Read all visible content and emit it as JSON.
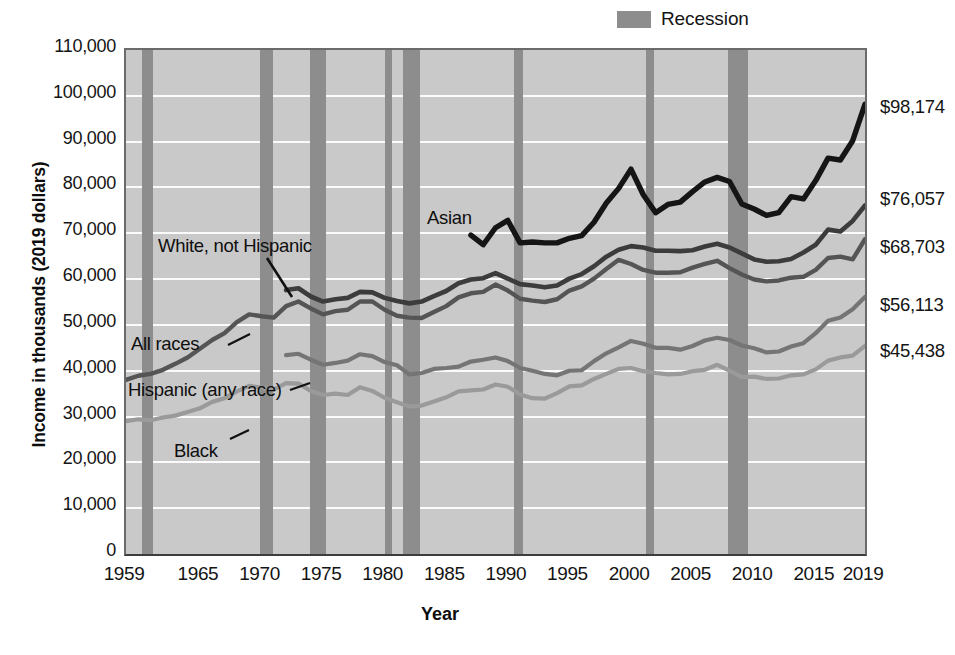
{
  "legend": {
    "recession_label": "Recession",
    "swatch_color": "#8d8d8d"
  },
  "axes": {
    "ylabel": "Income in thousands (2019 dollars)",
    "xlabel": "Year",
    "yticks": [
      "0",
      "10,000",
      "20,000",
      "30,000",
      "40,000",
      "50,000",
      "60,000",
      "70,000",
      "80,000",
      "90,000",
      "100,000",
      "110,000"
    ],
    "xticks": [
      "1959",
      "1965",
      "1970",
      "1975",
      "1980",
      "1985",
      "1990",
      "1995",
      "2000",
      "2005",
      "2010",
      "2015",
      "2019"
    ]
  },
  "annotations": {
    "asian": "Asian",
    "white_not_hispanic": "White, not Hispanic",
    "all_races": "All races",
    "hispanic": "Hispanic (any race)",
    "black": "Black"
  },
  "end_labels": {
    "asian": "$98,174",
    "white_not_hispanic": "$76,057",
    "all_races": "$68,703",
    "hispanic": "$56,113",
    "black": "$45,438"
  },
  "chart_data": {
    "type": "line",
    "title": "",
    "xlabel": "Year",
    "ylabel": "Income in thousands (2019 dollars)",
    "xlim": [
      1959,
      2019
    ],
    "ylim": [
      0,
      110000
    ],
    "ytick_step": 10000,
    "grid": true,
    "legend_position": "top-right",
    "colors": {
      "asian": "#151515",
      "white_not_hispanic": "#3c3c3c",
      "all_races": "#555555",
      "hispanic": "#757575",
      "black": "#9a9a9a",
      "plot_background": "#c9c9c9",
      "gridline": "#fbfbfb",
      "recession_band": "#8d8d8d"
    },
    "recessions": [
      {
        "start": 1960.3,
        "end": 1961.2
      },
      {
        "start": 1969.9,
        "end": 1970.9
      },
      {
        "start": 1973.9,
        "end": 1975.2
      },
      {
        "start": 1980.0,
        "end": 1980.6
      },
      {
        "start": 1981.5,
        "end": 1982.9
      },
      {
        "start": 1990.5,
        "end": 1991.2
      },
      {
        "start": 2001.2,
        "end": 2001.9
      },
      {
        "start": 2007.9,
        "end": 2009.5
      }
    ],
    "series": [
      {
        "name": "Asian",
        "x": [
          1987,
          1988,
          1989,
          1990,
          1991,
          1992,
          1993,
          1994,
          1995,
          1996,
          1997,
          1998,
          1999,
          2000,
          2001,
          2002,
          2003,
          2004,
          2005,
          2006,
          2007,
          2008,
          2009,
          2010,
          2011,
          2012,
          2013,
          2014,
          2015,
          2016,
          2017,
          2018,
          2019
        ],
        "values": [
          69600,
          67500,
          71200,
          72800,
          67900,
          68100,
          67900,
          67900,
          68900,
          69500,
          72400,
          76600,
          79800,
          84000,
          78400,
          74500,
          76300,
          76800,
          79100,
          81200,
          82200,
          81300,
          76400,
          75300,
          73900,
          74500,
          78000,
          77500,
          81500,
          86400,
          86000,
          90200,
          98174
        ]
      },
      {
        "name": "White, not Hispanic",
        "x": [
          1972,
          1973,
          1974,
          1975,
          1976,
          1977,
          1978,
          1979,
          1980,
          1981,
          1982,
          1983,
          1984,
          1985,
          1986,
          1987,
          1988,
          1989,
          1990,
          1991,
          1992,
          1993,
          1994,
          1995,
          1996,
          1997,
          1998,
          1999,
          2000,
          2001,
          2002,
          2003,
          2004,
          2005,
          2006,
          2007,
          2008,
          2009,
          2010,
          2011,
          2012,
          2013,
          2014,
          2015,
          2016,
          2017,
          2018,
          2019
        ],
        "values": [
          57600,
          58000,
          56200,
          55100,
          55600,
          55900,
          57200,
          57100,
          55900,
          55200,
          54700,
          55100,
          56300,
          57400,
          59100,
          59900,
          60200,
          61300,
          60100,
          58900,
          58600,
          58200,
          58600,
          60100,
          61100,
          62800,
          64900,
          66400,
          67200,
          66900,
          66200,
          66200,
          66100,
          66300,
          67100,
          67700,
          66900,
          65600,
          64300,
          63800,
          63900,
          64400,
          65800,
          67500,
          70800,
          70400,
          72700,
          76057
        ]
      },
      {
        "name": "All races",
        "x": [
          1959,
          1960,
          1961,
          1962,
          1963,
          1964,
          1965,
          1966,
          1967,
          1968,
          1969,
          1970,
          1971,
          1972,
          1973,
          1974,
          1975,
          1976,
          1977,
          1978,
          1979,
          1980,
          1981,
          1982,
          1983,
          1984,
          1985,
          1986,
          1987,
          1988,
          1989,
          1990,
          1991,
          1992,
          1993,
          1994,
          1995,
          1996,
          1997,
          1998,
          1999,
          2000,
          2001,
          2002,
          2003,
          2004,
          2005,
          2006,
          2007,
          2008,
          2009,
          2010,
          2011,
          2012,
          2013,
          2014,
          2015,
          2016,
          2017,
          2018,
          2019
        ],
        "values": [
          38000,
          38900,
          39300,
          40200,
          41500,
          42900,
          44800,
          46700,
          48200,
          50600,
          52300,
          51900,
          51600,
          54100,
          55100,
          53600,
          52300,
          53000,
          53300,
          55100,
          55100,
          53300,
          52000,
          51600,
          51500,
          52800,
          54100,
          56000,
          56900,
          57200,
          58800,
          57500,
          55700,
          55300,
          55000,
          55600,
          57500,
          58400,
          60100,
          62200,
          64200,
          63300,
          62000,
          61400,
          61400,
          61500,
          62500,
          63300,
          64000,
          62400,
          61000,
          59900,
          59500,
          59700,
          60300,
          60500,
          62000,
          64600,
          64900,
          64300,
          68703
        ]
      },
      {
        "name": "Hispanic (any race)",
        "x": [
          1972,
          1973,
          1974,
          1975,
          1976,
          1977,
          1978,
          1979,
          1980,
          1981,
          1982,
          1983,
          1984,
          1985,
          1986,
          1987,
          1988,
          1989,
          1990,
          1991,
          1992,
          1993,
          1994,
          1995,
          1996,
          1997,
          1998,
          1999,
          2000,
          2001,
          2002,
          2003,
          2004,
          2005,
          2006,
          2007,
          2008,
          2009,
          2010,
          2011,
          2012,
          2013,
          2014,
          2015,
          2016,
          2017,
          2018,
          2019
        ],
        "values": [
          43400,
          43700,
          42400,
          41300,
          41700,
          42200,
          43600,
          43200,
          41900,
          41200,
          39200,
          39500,
          40400,
          40600,
          40900,
          42000,
          42400,
          42900,
          42100,
          40600,
          40000,
          39300,
          39000,
          40000,
          40100,
          42100,
          43800,
          45100,
          46500,
          45900,
          45000,
          45000,
          44600,
          45400,
          46600,
          47200,
          46700,
          45500,
          44900,
          44000,
          44200,
          45300,
          46000,
          48200,
          50900,
          51600,
          53400,
          56113
        ]
      },
      {
        "name": "Black",
        "x": [
          1959,
          1960,
          1961,
          1962,
          1963,
          1964,
          1965,
          1966,
          1967,
          1968,
          1969,
          1970,
          1971,
          1972,
          1973,
          1974,
          1975,
          1976,
          1977,
          1978,
          1979,
          1980,
          1981,
          1982,
          1983,
          1984,
          1985,
          1986,
          1987,
          1988,
          1989,
          1990,
          1991,
          1992,
          1993,
          1994,
          1995,
          1996,
          1997,
          1998,
          1999,
          2000,
          2001,
          2002,
          2003,
          2004,
          2005,
          2006,
          2007,
          2008,
          2009,
          2010,
          2011,
          2012,
          2013,
          2014,
          2015,
          2016,
          2017,
          2018,
          2019
        ],
        "values": [
          29000,
          29400,
          29200,
          29800,
          30200,
          31000,
          31800,
          33200,
          34000,
          35500,
          36700,
          36300,
          35900,
          37300,
          37200,
          35600,
          34700,
          35000,
          34700,
          36400,
          35600,
          34100,
          33100,
          32200,
          32400,
          33300,
          34200,
          35500,
          35700,
          35900,
          37000,
          36500,
          34800,
          34000,
          33900,
          35100,
          36600,
          36800,
          38200,
          39300,
          40400,
          40600,
          39900,
          39500,
          39200,
          39300,
          39900,
          40200,
          41300,
          40000,
          38600,
          38700,
          38200,
          38300,
          39000,
          39200,
          40300,
          42200,
          42900,
          43300,
          45438
        ]
      }
    ]
  }
}
